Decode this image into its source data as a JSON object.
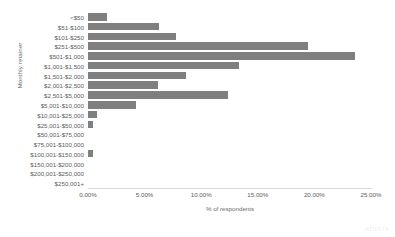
{
  "chart_data": {
    "type": "bar",
    "orientation": "horizontal",
    "title": "",
    "xlabel": "% of respondents",
    "ylabel": "Monthly retainer",
    "xlim": [
      0,
      25
    ],
    "xticks": [
      "0.00%",
      "5.00%",
      "10.00%",
      "15.00%",
      "20.00%",
      "25.00%"
    ],
    "xtick_values": [
      0,
      5,
      10,
      15,
      20,
      25
    ],
    "grid": false,
    "legend": null,
    "bar_color": "#7f7f7f",
    "categories": [
      "<$50",
      "$51-$100",
      "$101-$250",
      "$251-$500",
      "$501-$1,000",
      "$1,001-$1,500",
      "$1,501-$2,000",
      "$2,001-$2,500",
      "$2,501-$5,000",
      "$5,001-$10,000",
      "$10,001-$25,000",
      "$25,001-$50,000",
      "$50,001-$75,000",
      "$75,001-$100,000",
      "$100,001-$150,000",
      "$150,001-$200,000",
      "$200,001-$250,000",
      "$250,001+"
    ],
    "values": [
      1.7,
      6.3,
      7.8,
      19.4,
      23.6,
      13.3,
      8.7,
      6.2,
      12.4,
      4.2,
      0.8,
      0.45,
      0,
      0,
      0.45,
      0,
      0,
      0
    ]
  },
  "watermark": "ahrefs"
}
